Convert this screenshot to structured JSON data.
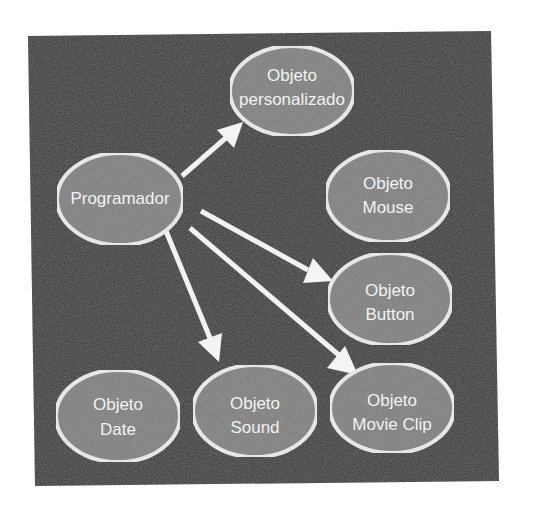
{
  "diagram": {
    "background_color": "#ffffff",
    "panel_color": "#2b2b2b",
    "node_fill": "#7d7d7d",
    "node_stroke": "#ededed",
    "text_color": "#f2f2f2",
    "arrow_color": "#f2f2f2",
    "nodes": [
      {
        "id": "programador",
        "lines": [
          "Programador"
        ]
      },
      {
        "id": "objeto-personalizado",
        "lines": [
          "Objeto",
          "personalizado"
        ]
      },
      {
        "id": "objeto-mouse",
        "lines": [
          "Objeto",
          "Mouse"
        ]
      },
      {
        "id": "objeto-button",
        "lines": [
          "Objeto",
          "Button"
        ]
      },
      {
        "id": "objeto-date",
        "lines": [
          "Objeto",
          "Date"
        ]
      },
      {
        "id": "objeto-sound",
        "lines": [
          "Objeto",
          "Sound"
        ]
      },
      {
        "id": "objeto-movie-clip",
        "lines": [
          "Objeto",
          "Movie Clip"
        ]
      }
    ],
    "edges": [
      {
        "from": "programador",
        "to": "objeto-personalizado"
      },
      {
        "from": "programador",
        "to": "objeto-button"
      },
      {
        "from": "programador",
        "to": "objeto-movie-clip"
      },
      {
        "from": "programador",
        "to": "objeto-sound"
      }
    ]
  }
}
